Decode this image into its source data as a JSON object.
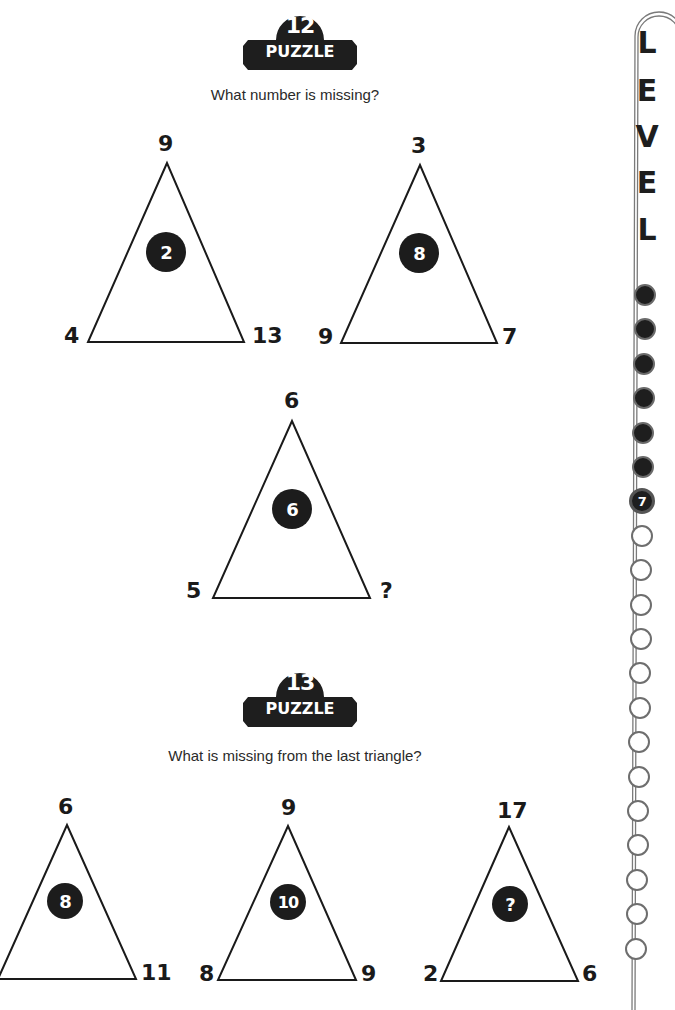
{
  "puzzles": [
    {
      "number": "12",
      "badge_label": "PUZZLE",
      "question": "What number is missing?",
      "triangles": [
        {
          "top": "9",
          "left": "4",
          "right": "13",
          "center": "2"
        },
        {
          "top": "3",
          "left": "9",
          "right": "7",
          "center": "8"
        },
        {
          "top": "6",
          "left": "5",
          "right": "?",
          "center": "6"
        }
      ]
    },
    {
      "number": "13",
      "badge_label": "PUZZLE",
      "question": "What is missing from the last triangle?",
      "triangles": [
        {
          "top": "6",
          "left": "",
          "right": "11",
          "center": "8"
        },
        {
          "top": "9",
          "left": "8",
          "right": "9",
          "center": "10"
        },
        {
          "top": "17",
          "left": "2",
          "right": "6",
          "center": "?"
        }
      ]
    }
  ],
  "level": {
    "letters": [
      "L",
      "E",
      "V",
      "E",
      "L"
    ],
    "current": "7",
    "total_steps": 20,
    "completed_steps": 6
  },
  "colors": {
    "ink": "#1e1e1e",
    "outline": "#6e6e6e",
    "paper": "#ffffff"
  }
}
